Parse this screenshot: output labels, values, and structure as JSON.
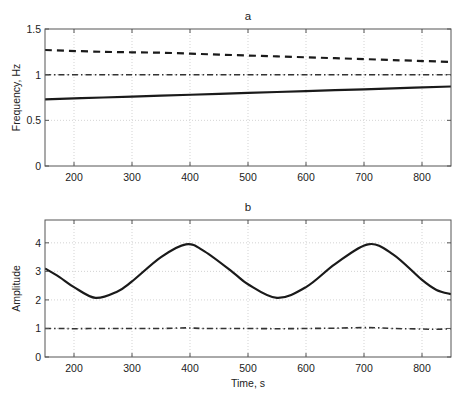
{
  "chart_data": [
    {
      "type": "line",
      "panel_label": "a",
      "title": "a",
      "xlabel": "",
      "ylabel": "Frequency, Hz",
      "xlim": [
        150,
        850
      ],
      "ylim": [
        0,
        1.5
      ],
      "xticks": [
        200,
        300,
        400,
        500,
        600,
        700,
        800
      ],
      "yticks": [
        0,
        0.5,
        1,
        1.5
      ],
      "ytick_labels": [
        "0",
        "0.5",
        "1",
        "1.5"
      ],
      "grid": true,
      "legend": null,
      "x": [
        150,
        250,
        350,
        450,
        550,
        650,
        750,
        850
      ],
      "series": [
        {
          "name": "dashed",
          "style": "dashed",
          "values": [
            1.27,
            1.25,
            1.24,
            1.22,
            1.2,
            1.18,
            1.16,
            1.14
          ]
        },
        {
          "name": "dash-dot",
          "style": "dashdot",
          "values": [
            1.0,
            1.0,
            1.0,
            1.0,
            1.0,
            1.0,
            1.0,
            1.0
          ]
        },
        {
          "name": "solid",
          "style": "solid",
          "values": [
            0.73,
            0.75,
            0.77,
            0.79,
            0.81,
            0.83,
            0.85,
            0.87
          ]
        }
      ]
    },
    {
      "type": "line",
      "panel_label": "b",
      "title": "b",
      "xlabel": "Time, s",
      "ylabel": "Amplitude",
      "xlim": [
        150,
        850
      ],
      "ylim": [
        0,
        4.8
      ],
      "xticks": [
        200,
        300,
        400,
        500,
        600,
        700,
        800
      ],
      "yticks": [
        0,
        1,
        2,
        3,
        4
      ],
      "ytick_labels": [
        "0",
        "1",
        "2",
        "3",
        "4"
      ],
      "grid": true,
      "legend": null,
      "x": [
        150,
        175,
        200,
        237,
        275,
        300,
        350,
        393,
        425,
        475,
        500,
        550,
        600,
        650,
        707,
        750,
        800,
        825,
        850
      ],
      "series": [
        {
          "name": "solid",
          "style": "solid",
          "values": [
            3.1,
            2.8,
            2.45,
            2.07,
            2.3,
            2.65,
            3.5,
            3.95,
            3.7,
            2.95,
            2.55,
            2.07,
            2.45,
            3.25,
            3.95,
            3.6,
            2.7,
            2.35,
            2.2
          ]
        },
        {
          "name": "dash-dot",
          "style": "dashdot",
          "values": [
            1.0,
            1.0,
            0.99,
            1.0,
            1.0,
            1.0,
            1.0,
            1.02,
            1.0,
            1.0,
            1.0,
            0.99,
            1.0,
            1.01,
            1.03,
            1.0,
            0.98,
            0.97,
            0.99
          ]
        }
      ]
    }
  ]
}
